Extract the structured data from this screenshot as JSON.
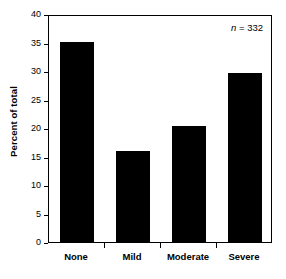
{
  "chart_data": {
    "type": "bar",
    "title": "",
    "subtitle": "",
    "xlabel": "",
    "ylabel": "Percent of total",
    "categories": [
      "None",
      "Mild",
      "Moderate",
      "Severe"
    ],
    "values": [
      35.1,
      16.0,
      20.3,
      29.6
    ],
    "ylim": [
      0,
      40
    ],
    "ytick_values": [
      0,
      5,
      10,
      15,
      20,
      25,
      30,
      35,
      40
    ],
    "ytick_labels": [
      "0",
      "5",
      "10",
      "15",
      "20",
      "25",
      "30",
      "35",
      "40"
    ],
    "grid": false,
    "legend": false,
    "legend_position": "none",
    "bar_color": "#000000",
    "frame_color": "#000000",
    "background_color": "#ffffff",
    "annotations": [
      {
        "name": "sample-size",
        "variable": "n",
        "separator": " = ",
        "value": "332",
        "text": "n = 332",
        "position": "top-right"
      }
    ]
  },
  "axes": {
    "y_title": "Percent of total",
    "y_ticks": [
      "0",
      "5",
      "10",
      "15",
      "20",
      "25",
      "30",
      "35",
      "40"
    ],
    "x_ticks": [
      "None",
      "Mild",
      "Moderate",
      "Severe"
    ]
  },
  "annotation": {
    "n_symbol": "n",
    "n_equals": " = ",
    "n_value": "332"
  }
}
